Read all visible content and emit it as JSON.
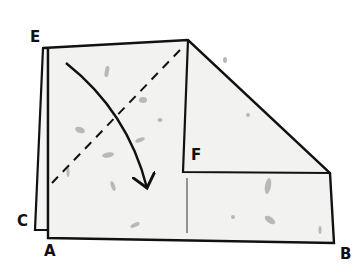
{
  "diagram": {
    "type": "origami-fold-step",
    "labels": {
      "E": "E",
      "F": "F",
      "C": "C",
      "A": "A",
      "B": "B"
    },
    "instruction": {
      "fold_line": "dashed diagonal valley fold",
      "arrow": "curved arrow indicating fold direction downward"
    },
    "colors": {
      "paper": "#f2f2f0",
      "outline": "#111111",
      "speckle": "#b8b8b8",
      "background": "#ffffff"
    }
  }
}
